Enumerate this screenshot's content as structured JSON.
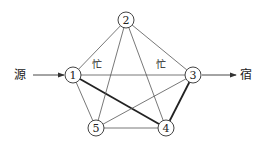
{
  "diagram": {
    "type": "network-graph",
    "source_label": "源",
    "sink_label": "宿",
    "busy_labels": [
      "忙",
      "忙"
    ],
    "nodes": [
      {
        "id": "1",
        "label": "1",
        "x": 73,
        "y": 75
      },
      {
        "id": "2",
        "label": "2",
        "x": 126,
        "y": 20
      },
      {
        "id": "3",
        "label": "3",
        "x": 193,
        "y": 75
      },
      {
        "id": "4",
        "label": "4",
        "x": 166,
        "y": 128
      },
      {
        "id": "5",
        "label": "5",
        "x": 96,
        "y": 128
      }
    ],
    "edges": [
      {
        "from": "1",
        "to": "2",
        "bold": false
      },
      {
        "from": "2",
        "to": "3",
        "bold": false
      },
      {
        "from": "1",
        "to": "3",
        "bold": false,
        "label": "忙"
      },
      {
        "from": "1",
        "to": "5",
        "bold": false
      },
      {
        "from": "1",
        "to": "4",
        "bold": true
      },
      {
        "from": "2",
        "to": "5",
        "bold": false
      },
      {
        "from": "2",
        "to": "4",
        "bold": false
      },
      {
        "from": "3",
        "to": "5",
        "bold": false
      },
      {
        "from": "3",
        "to": "4",
        "bold": true
      },
      {
        "from": "5",
        "to": "4",
        "bold": false
      }
    ],
    "arrows": [
      {
        "from": "源",
        "to": "1"
      },
      {
        "from": "3",
        "to": "宿"
      }
    ]
  }
}
